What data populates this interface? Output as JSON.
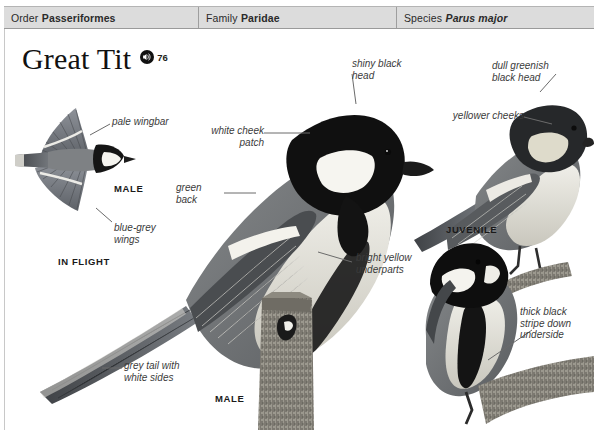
{
  "taxonomy": [
    {
      "rank": "Order",
      "value": "Passeriformes",
      "italic": false
    },
    {
      "rank": "Family",
      "value": "Paridae",
      "italic": false
    },
    {
      "rank": "Species",
      "value": "Parus major",
      "italic": true
    }
  ],
  "title": {
    "common_name": "Great Tit",
    "audio_icon": "speaker-icon",
    "audio_track_number": "76"
  },
  "annotations": [
    {
      "id": "pale-wingbar",
      "text": "pale wingbar"
    },
    {
      "id": "blue-grey-wings",
      "text": "blue-grey\nwings"
    },
    {
      "id": "white-cheek-patch",
      "text": "white cheek\npatch"
    },
    {
      "id": "green-back",
      "text": "green\nback"
    },
    {
      "id": "shiny-black-head",
      "text": "shiny black\nhead"
    },
    {
      "id": "bright-yellow-underparts",
      "text": "bright yellow\nunderparts"
    },
    {
      "id": "grey-tail-white-sides",
      "text": "grey tail with\nwhite sides"
    },
    {
      "id": "dull-greenish-black-head",
      "text": "dull greenish\nblack head"
    },
    {
      "id": "yellower-cheeks",
      "text": "yellower cheeks"
    },
    {
      "id": "thick-black-stripe",
      "text": "thick black\nstripe down\nunderside"
    }
  ],
  "plate_captions": [
    {
      "id": "male-in-flight",
      "text": "MALE"
    },
    {
      "id": "in-flight",
      "text": "IN FLIGHT"
    },
    {
      "id": "juvenile",
      "text": "JUVENILE"
    },
    {
      "id": "male-perched",
      "text": "MALE"
    }
  ],
  "colors": {
    "header_bg": "#dcdcdc",
    "header_text": "#2a2a2a",
    "label_text": "#3b3b3b",
    "leader_line": "#6b6b6b",
    "page_bg": "#ffffff"
  }
}
